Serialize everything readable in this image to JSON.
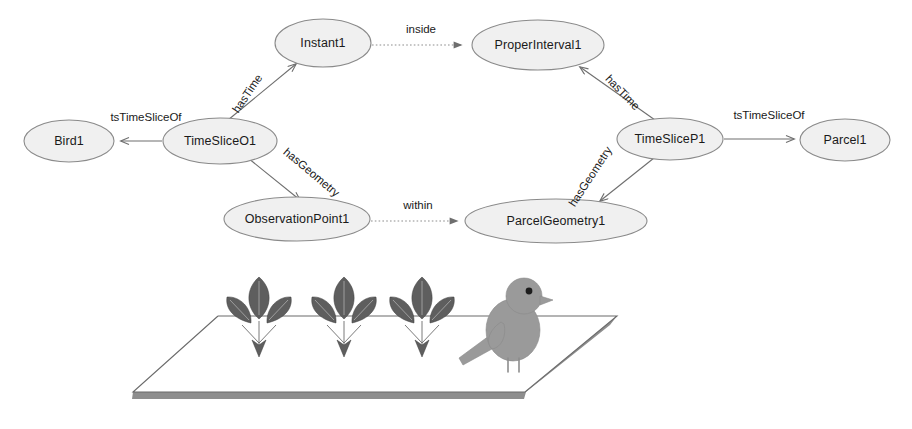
{
  "diagram": {
    "colors": {
      "node_fill": "#f0f0f0",
      "node_stroke": "#8a8a8a",
      "edge_solid": "#6e6e6e",
      "edge_dotted": "#8d8d8d",
      "leaf": "#5e5e5e",
      "bird": "#9a9a9a",
      "plane_edge": "#8e8e8e",
      "text": "#1a1a1a"
    },
    "nodes": [
      {
        "id": "instant1",
        "label": "Instant1",
        "cx": 323,
        "cy": 43,
        "rx": 48,
        "ry": 24
      },
      {
        "id": "properinterval1",
        "label": "ProperInterval1",
        "cx": 538,
        "cy": 45,
        "rx": 66,
        "ry": 25
      },
      {
        "id": "bird1",
        "label": "Bird1",
        "cx": 69,
        "cy": 141,
        "rx": 45,
        "ry": 21
      },
      {
        "id": "timesliceo1",
        "label": "TimeSliceO1",
        "cx": 220,
        "cy": 141,
        "rx": 57,
        "ry": 23
      },
      {
        "id": "timeslicep1",
        "label": "TimeSliceP1",
        "cx": 670,
        "cy": 139,
        "rx": 53,
        "ry": 21
      },
      {
        "id": "parcel1",
        "label": "Parcel1",
        "cx": 845,
        "cy": 140,
        "rx": 45,
        "ry": 21
      },
      {
        "id": "observationpoint1",
        "label": "ObservationPoint1",
        "cx": 297,
        "cy": 219,
        "rx": 73,
        "ry": 22
      },
      {
        "id": "parcelgeometry1",
        "label": "ParcelGeometry1",
        "cx": 556,
        "cy": 221,
        "rx": 91,
        "ry": 22
      }
    ],
    "edges": [
      {
        "id": "instant-inside-properinterval",
        "label": "inside",
        "style": "dotted",
        "from": "instant1",
        "to": "properinterval1",
        "label_x": 421,
        "label_y": 30,
        "rotate": 0
      },
      {
        "id": "timesliceo1-hastime-instant1",
        "label": "hasTime",
        "style": "solid",
        "from": "timesliceo1",
        "to": "instant1",
        "label_x": 248,
        "label_y": 94,
        "rotate": -56
      },
      {
        "id": "timesliceo1-tstimesliceof-bird1",
        "label": "tsTimeSliceOf",
        "style": "solid",
        "from": "timesliceo1",
        "to": "bird1",
        "label_x": 146,
        "label_y": 118,
        "rotate": 0
      },
      {
        "id": "timesliceo1-hasgeometry-observationpoint1",
        "label": "hasGeometry",
        "style": "solid",
        "from": "timesliceo1",
        "to": "observationpoint1",
        "label_x": 311,
        "label_y": 173,
        "rotate": 40
      },
      {
        "id": "observationpoint1-within-parcelgeometry1",
        "label": "within",
        "style": "dotted",
        "from": "observationpoint1",
        "to": "parcelgeometry1",
        "label_x": 418,
        "label_y": 206,
        "rotate": 0
      },
      {
        "id": "timeslicep1-hastime-properinterval1",
        "label": "hasTime",
        "style": "solid",
        "from": "timeslicep1",
        "to": "properinterval1",
        "label_x": 622,
        "label_y": 93,
        "rotate": 46
      },
      {
        "id": "timeslicep1-tstimesliceof-parcel1",
        "label": "tsTimeSliceOf",
        "style": "solid",
        "from": "timeslicep1",
        "to": "parcel1",
        "label_x": 769,
        "label_y": 116,
        "rotate": 0
      },
      {
        "id": "timeslicep1-hasgeometry-parcelgeometry1",
        "label": "hasGeometry",
        "style": "solid",
        "from": "timeslicep1",
        "to": "parcelgeometry1",
        "label_x": 591,
        "label_y": 177,
        "rotate": -57
      }
    ],
    "illustration": {
      "name": "bird-on-parcel-illustration",
      "plane": {
        "top_left_x": 218,
        "top_left_y": 316,
        "top_right_x": 617,
        "top_right_y": 316,
        "bottom_left_x": 133,
        "bottom_left_y": 392,
        "bottom_right_x": 525,
        "bottom_right_y": 392
      },
      "plants": [
        {
          "name": "plant-1",
          "x": 259,
          "y": 317
        },
        {
          "name": "plant-2",
          "x": 344,
          "y": 317
        },
        {
          "name": "plant-3",
          "x": 422,
          "y": 317
        }
      ],
      "bird": {
        "name": "bird-figure",
        "x": 505,
        "y": 318
      }
    }
  }
}
